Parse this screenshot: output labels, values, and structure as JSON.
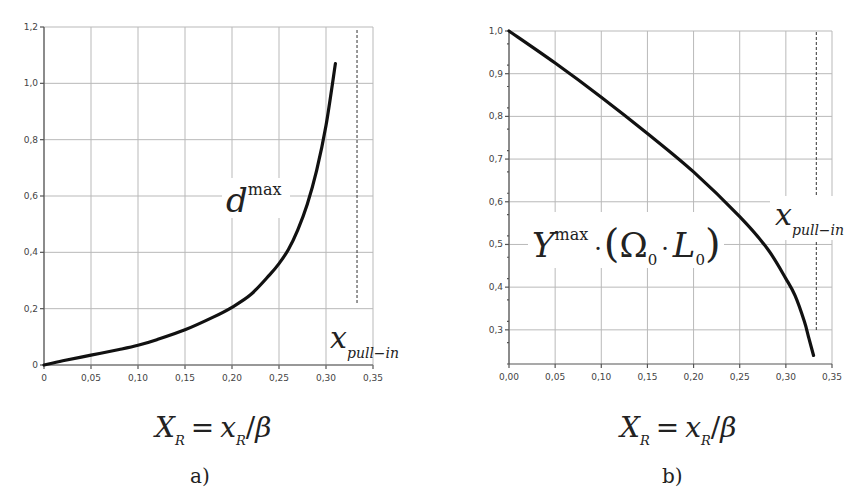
{
  "chart_data": [
    {
      "id": "a",
      "type": "line",
      "caption": "a)",
      "title": "",
      "xlabel": "X_R = x_R / β",
      "ylabel": "",
      "curve_label": "d^max",
      "curve_label_base": "d",
      "curve_label_sup": "max",
      "annotation": "x_pull-in",
      "annotation_base": "x",
      "annotation_sub": "pull−in",
      "xlim": [
        0,
        0.35
      ],
      "ylim": [
        0,
        1.2
      ],
      "grid": true,
      "x_ticks": [
        "0",
        "0,05",
        "0,10",
        "0,15",
        "0,20",
        "0,25",
        "0,30",
        "0,35"
      ],
      "y_ticks": [
        "0",
        "0,2",
        "0,4",
        "0,6",
        "0,8",
        "1,0",
        "1,2"
      ],
      "pull_in_x": 0.333,
      "series": [
        {
          "name": "d^max",
          "x": [
            0,
            0.02,
            0.05,
            0.08,
            0.1,
            0.12,
            0.15,
            0.18,
            0.2,
            0.22,
            0.24,
            0.25,
            0.26,
            0.27,
            0.28,
            0.29,
            0.3,
            0.31
          ],
          "y": [
            0,
            0.015,
            0.035,
            0.055,
            0.07,
            0.09,
            0.125,
            0.17,
            0.205,
            0.25,
            0.32,
            0.36,
            0.41,
            0.48,
            0.57,
            0.69,
            0.85,
            1.07
          ]
        }
      ]
    },
    {
      "id": "b",
      "type": "line",
      "caption": "b)",
      "title": "",
      "xlabel": "X_R = x_R / β",
      "ylabel": "",
      "curve_label": "Y^max · (Ω_0 · L_0)",
      "annotation": "x_pull-in",
      "annotation_base": "x",
      "annotation_sub": "pull−in",
      "xlim": [
        0,
        0.35
      ],
      "ylim": [
        0.22,
        1.0
      ],
      "grid": true,
      "x_ticks": [
        "0,00",
        "0,05",
        "0,10",
        "0,15",
        "0,20",
        "0,25",
        "0,30",
        "0,35"
      ],
      "y_ticks": [
        "0,3",
        "0,4",
        "0,5",
        "0,6",
        "0,7",
        "0,8",
        "0,9",
        "1,0"
      ],
      "pull_in_x": 0.333,
      "series": [
        {
          "name": "Y^max·(Ω0·L0)",
          "x": [
            0,
            0.05,
            0.1,
            0.15,
            0.2,
            0.25,
            0.28,
            0.3,
            0.31,
            0.32,
            0.325,
            0.33
          ],
          "y": [
            1.0,
            0.925,
            0.845,
            0.76,
            0.67,
            0.565,
            0.49,
            0.42,
            0.38,
            0.32,
            0.28,
            0.24
          ]
        }
      ]
    }
  ],
  "labels": {
    "a_caption": "a)",
    "b_caption": "b)",
    "a_curve_base": "d",
    "a_curve_sup": "max",
    "b_curve_Y": "Y",
    "b_curve_sup": "max",
    "b_curve_dot": "·",
    "b_curve_lparen": "(",
    "b_curve_omega": "Ω",
    "b_curve_omega_sub": "0",
    "b_curve_dot2": "·",
    "b_curve_L": "L",
    "b_curve_L_sub": "0",
    "b_curve_rparen": ")",
    "pull_base": "x",
    "pull_sub": "pull−in",
    "xlabel_X": "X",
    "xlabel_sub1": "R",
    "xlabel_eq": "=",
    "xlabel_x": "x",
    "xlabel_sub2": "R",
    "xlabel_slash": "/",
    "xlabel_beta": "β"
  }
}
